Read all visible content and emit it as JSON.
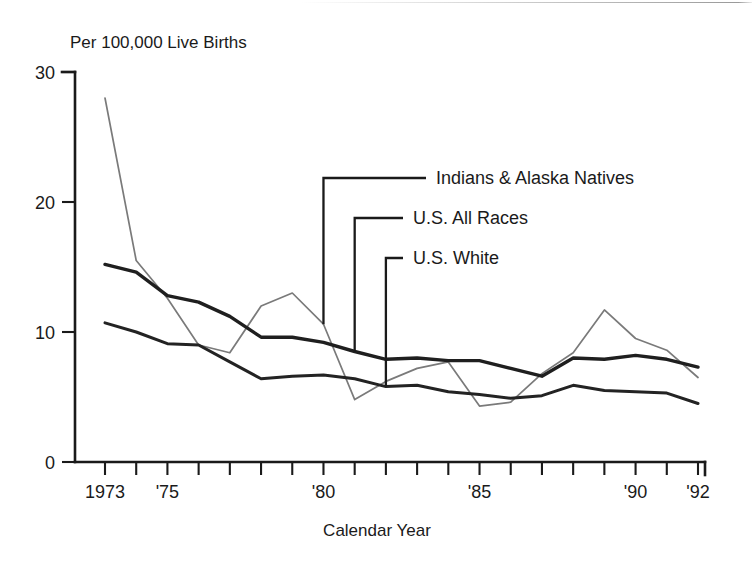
{
  "figure": {
    "background": "#ffffff",
    "ink_color": "#1a1a1a",
    "scan_artifact_present": true
  },
  "chart_data": {
    "type": "line",
    "title": "",
    "subtitle": "",
    "ylabel": "Per 100,000 Live Births",
    "xlabel": "Calendar Year",
    "xlim": [
      1973,
      1992
    ],
    "ylim": [
      0,
      30
    ],
    "yticks": [
      0,
      10,
      20,
      30
    ],
    "ytick_labels": [
      "0",
      "10",
      "20",
      "30"
    ],
    "x": [
      1973,
      1974,
      1975,
      1976,
      1977,
      1978,
      1979,
      1980,
      1981,
      1982,
      1983,
      1984,
      1985,
      1986,
      1987,
      1988,
      1989,
      1990,
      1991,
      1992
    ],
    "xticks": [
      1973,
      1974,
      1975,
      1976,
      1977,
      1978,
      1979,
      1980,
      1981,
      1982,
      1983,
      1984,
      1985,
      1986,
      1987,
      1988,
      1989,
      1990,
      1991,
      1992
    ],
    "xtick_labels": [
      {
        "year": 1973,
        "label": "1973"
      },
      {
        "year": 1975,
        "label": "'75"
      },
      {
        "year": 1980,
        "label": "'80"
      },
      {
        "year": 1985,
        "label": "'85"
      },
      {
        "year": 1990,
        "label": "'90"
      },
      {
        "year": 1992,
        "label": "'92"
      }
    ],
    "grid": false,
    "legend_position": "in-plot-leader-lines",
    "series": [
      {
        "name": "Indians & Alaska Natives",
        "color": "#7a7a7a",
        "style": "thin",
        "values": [
          28.0,
          15.5,
          12.6,
          9.0,
          8.4,
          12.0,
          13.0,
          10.6,
          4.8,
          6.2,
          7.2,
          7.7,
          4.3,
          4.6,
          6.8,
          8.4,
          11.7,
          9.5,
          8.6,
          6.5
        ]
      },
      {
        "name": "U.S. All Races",
        "color": "#1f1f1f",
        "style": "thick",
        "values": [
          15.2,
          14.6,
          12.8,
          12.3,
          11.2,
          9.6,
          9.6,
          9.2,
          8.5,
          7.9,
          8.0,
          7.8,
          7.8,
          7.2,
          6.6,
          8.0,
          7.9,
          8.2,
          7.9,
          7.3
        ]
      },
      {
        "name": "U.S. White",
        "color": "#232323",
        "style": "mid",
        "values": [
          10.7,
          10.0,
          9.1,
          9.0,
          7.7,
          6.4,
          6.6,
          6.7,
          6.4,
          5.8,
          5.9,
          5.4,
          5.2,
          4.9,
          5.1,
          5.9,
          5.5,
          5.4,
          5.3,
          4.5
        ]
      }
    ],
    "annotations": [
      {
        "text": "Indians & Alaska Natives",
        "connects_to_series": "Indians & Alaska Natives",
        "connects_to_year": 1980,
        "label_x": 436,
        "label_y": 184
      },
      {
        "text": "U.S. All Races",
        "connects_to_series": "U.S. All Races",
        "connects_to_year": 1981,
        "label_x": 413,
        "label_y": 224
      },
      {
        "text": "U.S. White",
        "connects_to_series": "U.S. White",
        "connects_to_year": 1982,
        "label_x": 413,
        "label_y": 264
      }
    ]
  }
}
